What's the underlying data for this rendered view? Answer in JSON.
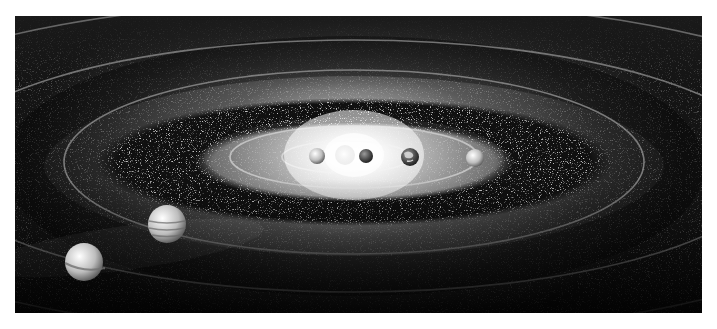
{
  "image": {
    "subject": "Solar system illustration (grayscale)",
    "frame": {
      "x": 15,
      "y": 16,
      "width": 687,
      "height": 297
    },
    "colors": {
      "background": "#ffffff",
      "space": "#0a0a0a",
      "glow": "#ffffff",
      "orbit": "#8a8a8a"
    }
  },
  "sun": {
    "cx": 339,
    "cy": 139
  },
  "orbits": [
    {
      "name": "orbit-1",
      "cx": 331,
      "cy": 141,
      "rx": 64,
      "ry": 16
    },
    {
      "name": "orbit-2",
      "cx": 339,
      "cy": 141,
      "rx": 124,
      "ry": 31
    },
    {
      "name": "orbit-3",
      "cx": 339,
      "cy": 146,
      "rx": 290,
      "ry": 92
    },
    {
      "name": "orbit-4",
      "cx": 339,
      "cy": 150,
      "rx": 420,
      "ry": 126
    },
    {
      "name": "orbit-5",
      "cx": 339,
      "cy": 152,
      "rx": 560,
      "ry": 168
    },
    {
      "name": "orbit-6",
      "cx": 339,
      "cy": 154,
      "rx": 720,
      "ry": 210
    },
    {
      "name": "orbit-7",
      "cx": 339,
      "cy": 160,
      "rx": 900,
      "ry": 250
    }
  ],
  "asteroid_belt": {
    "cx": 339,
    "cy": 146,
    "rx": 258,
    "ry": 64,
    "inner_rx": 150,
    "inner_ry": 40
  },
  "planets": [
    {
      "name": "mercury",
      "cx": 302,
      "cy": 140,
      "r": 8,
      "shade": "#d8d8d8"
    },
    {
      "name": "venus",
      "cx": 330,
      "cy": 139,
      "r": 10,
      "shade": "#eeeeee"
    },
    {
      "name": "mars-small",
      "cx": 351,
      "cy": 140,
      "r": 7,
      "shade": "#555555"
    },
    {
      "name": "earth",
      "cx": 395,
      "cy": 141,
      "r": 9,
      "shade": "#7a7a7a"
    },
    {
      "name": "mars",
      "cx": 460,
      "cy": 142,
      "r": 9,
      "shade": "#c8c8c8"
    },
    {
      "name": "jupiter",
      "cx": 152,
      "cy": 208,
      "r": 19,
      "shade": "#cfcfcf"
    },
    {
      "name": "saturn",
      "cx": 69,
      "cy": 246,
      "r": 19,
      "shade": "#e4e4e4"
    }
  ]
}
